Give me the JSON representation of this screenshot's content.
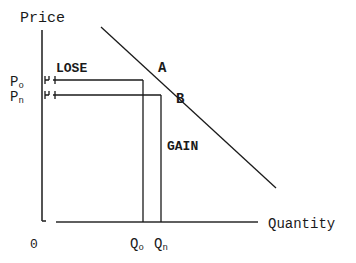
{
  "diagram": {
    "type": "demand-curve-price-change",
    "axes": {
      "y_label": "Price",
      "x_label": "Quantity",
      "origin_label": "0"
    },
    "price_labels": {
      "p_old": {
        "main": "P",
        "sub": "o"
      },
      "p_new": {
        "main": "P",
        "sub": "n"
      }
    },
    "quantity_labels": {
      "q_old": {
        "main": "Q",
        "sub": "o"
      },
      "q_new": {
        "main": "Q",
        "sub": "n"
      }
    },
    "points": {
      "a": "A",
      "b": "B"
    },
    "regions": {
      "lose": "LOSE",
      "gain": "GAIN"
    },
    "colors": {
      "line": "#1a1a1a",
      "background": "#ffffff"
    }
  }
}
